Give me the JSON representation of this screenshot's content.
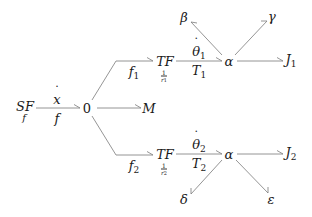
{
  "diagram": {
    "type": "bond-graph",
    "nodes": {
      "source": {
        "label": "SF",
        "sublabel": "f"
      },
      "junction0": {
        "label": "0"
      },
      "mass": {
        "label": "M"
      },
      "tf_upper": {
        "label": "TF",
        "ratio_num": "1",
        "ratio_den": "r",
        "ratio_den_sub": "1"
      },
      "tf_lower": {
        "label": "TF",
        "ratio_num": "1",
        "ratio_den": "r",
        "ratio_den_sub": "2"
      },
      "alpha_upper": {
        "label": "α"
      },
      "alpha_lower": {
        "label": "α"
      },
      "beta": {
        "label": "β"
      },
      "gamma": {
        "label": "γ"
      },
      "delta": {
        "label": "δ"
      },
      "epsilon": {
        "label": "ε"
      },
      "j1": {
        "label": "J",
        "sub": "1"
      },
      "j2": {
        "label": "J",
        "sub": "2"
      }
    },
    "edges": {
      "sf_to_0": {
        "top": "x",
        "bottom": "f"
      },
      "upper_branch": {
        "label": "f",
        "sub": "1"
      },
      "lower_branch": {
        "label": "f",
        "sub": "2"
      },
      "tf1_to_alpha": {
        "top": "θ",
        "top_sub": "1",
        "bottom": "T",
        "bottom_sub": "1"
      },
      "tf2_to_alpha": {
        "top": "θ",
        "top_sub": "2",
        "bottom": "T",
        "bottom_sub": "2"
      }
    },
    "colors": {
      "line": "#7a7a7a",
      "text": "#1a1a1a"
    }
  }
}
